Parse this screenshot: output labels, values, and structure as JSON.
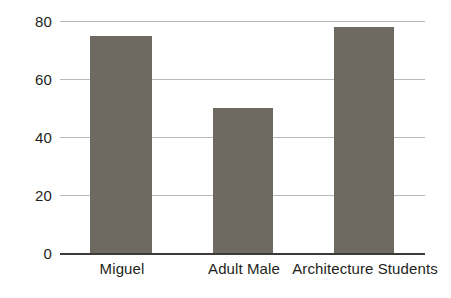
{
  "chart_data": {
    "type": "bar",
    "title": "",
    "subtitle": "",
    "xlabel": "",
    "ylabel": "",
    "categories": [
      "Miguel",
      "Adult Male",
      "Architecture Students"
    ],
    "values": [
      75,
      50,
      78
    ],
    "series": [
      {
        "name": "",
        "values": [
          75,
          50,
          78
        ]
      }
    ],
    "ylim": [
      0,
      80
    ],
    "yticks": [
      0,
      20,
      40,
      60,
      80
    ],
    "ytick_labels": [
      "0",
      "20",
      "40",
      "60",
      "80"
    ],
    "grid": "horizontal",
    "legend": "none",
    "annotations": [],
    "colors": {
      "bar_fill": "#6e6a62",
      "gridline": "#b9b9b9",
      "axis_line": "#3c3a38",
      "text": "#231f20",
      "background": "#ffffff"
    }
  }
}
